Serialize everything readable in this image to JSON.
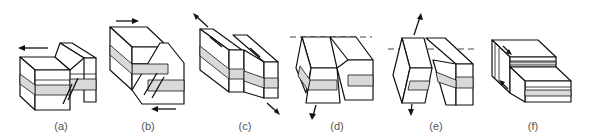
{
  "figure": {
    "panels": [
      {
        "id": "a",
        "label": "(a)"
      },
      {
        "id": "b",
        "label": "(b)"
      },
      {
        "id": "c",
        "label": "(c)"
      },
      {
        "id": "d",
        "label": "(d)"
      },
      {
        "id": "e",
        "label": "(e)"
      },
      {
        "id": "f",
        "label": "(f)"
      }
    ],
    "colors": {
      "stroke": "#111111",
      "layer_fill": "#d9d9d9",
      "block_fill": "#ffffff",
      "label": "#555555"
    }
  }
}
